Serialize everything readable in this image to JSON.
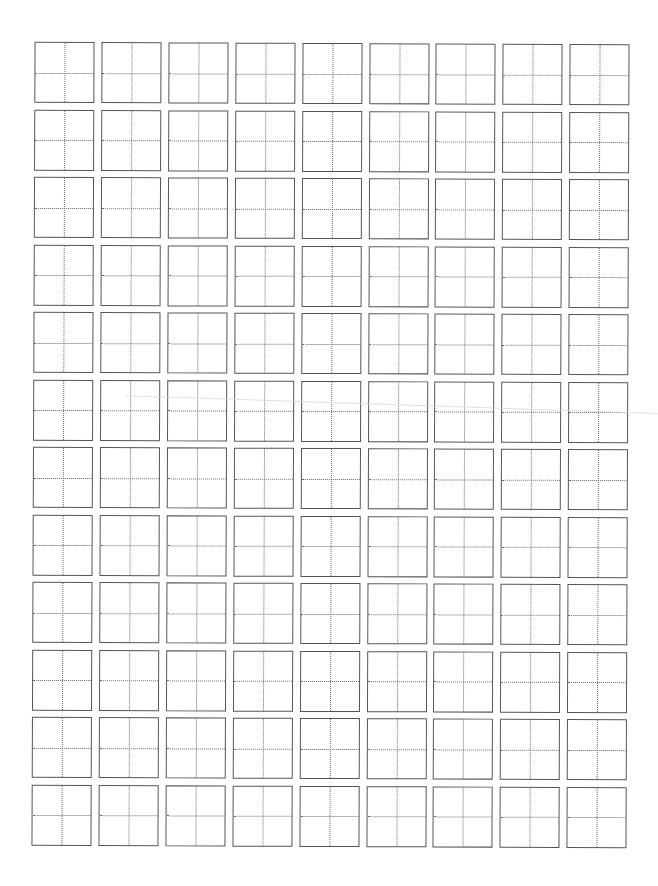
{
  "worksheet": {
    "type": "tianzige-practice-grid",
    "rows": 12,
    "columns": 9,
    "cell_size_px": 60,
    "column_pitch_px": 66.9,
    "row_pitch_px": 67.5,
    "origin_x_px": 33,
    "origin_y_px": 43,
    "cells_filled": 0,
    "colors": {
      "background": "#ffffff",
      "border": "#555555",
      "guide_line": "#6a6a6a"
    }
  }
}
